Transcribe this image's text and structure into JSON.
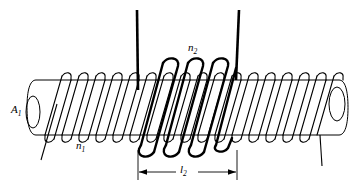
{
  "figure": {
    "labels": {
      "area_symbol": "A",
      "area_subscript": "1",
      "primary_turns_symbol": "n",
      "primary_turns_subscript": "1",
      "secondary_turns_symbol": "n",
      "secondary_turns_subscript": "2",
      "length_symbol": "l",
      "length_subscript": "2"
    },
    "colors": {
      "stroke": "#000000",
      "background": "#ffffff"
    },
    "geometry": {
      "cylinder_top_y": 80,
      "cylinder_bottom_y": 135,
      "cylinder_left_x": 28,
      "cylinder_right_x": 344,
      "dimension_left_x": 138,
      "dimension_right_x": 237,
      "dimension_line_y": 172,
      "lead_left_x": 137,
      "lead_right_x": 238,
      "lead_top_y": 10
    }
  }
}
